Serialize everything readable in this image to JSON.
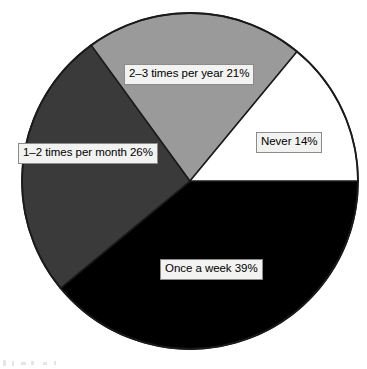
{
  "chart_data": {
    "type": "pie",
    "title": "",
    "subtitle": "",
    "xlabel": "",
    "ylabel": "",
    "legend_position": "none",
    "grid": false,
    "labels_on_slices": true,
    "start_angle_deg": 0,
    "direction": "counterclockwise",
    "categories": [
      "Never",
      "2–3 times per year",
      "1–2 times per month",
      "Once a week"
    ],
    "values": [
      14,
      21,
      26,
      39
    ],
    "value_unit": "%",
    "slices": [
      {
        "label": "Never",
        "value": 14,
        "percent_text": "14%",
        "data_label": "Never 14%",
        "color": "#ffffff",
        "start_angle_deg": 0.0,
        "end_angle_deg": 50.4
      },
      {
        "label": "2–3 times per year",
        "value": 21,
        "percent_text": "21%",
        "data_label": "2–3 times per year 21%",
        "color": "#9a9a9a",
        "start_angle_deg": 50.4,
        "end_angle_deg": 126.0
      },
      {
        "label": "1–2 times per month",
        "value": 26,
        "percent_text": "26%",
        "data_label": "1–2 times per month 26%",
        "color": "#3a3a3a",
        "start_angle_deg": 126.0,
        "end_angle_deg": 219.6
      },
      {
        "label": "Once a week",
        "value": 39,
        "percent_text": "39%",
        "data_label": "Once a week 39%",
        "color": "#000000",
        "start_angle_deg": 219.6,
        "end_angle_deg": 360.0
      }
    ]
  },
  "colors": {
    "background": "#ffffff",
    "outline": "#1a1a1a",
    "label_fill": "#f2f2f0",
    "label_border": "#8b8b8b",
    "label_text": "#000000",
    "slice_never": "#ffffff",
    "slice_year": "#9a9a9a",
    "slice_month": "#3a3a3a",
    "slice_week": "#000000"
  },
  "geometry": {
    "center_x": 190,
    "center_y": 181,
    "radius": 168
  }
}
